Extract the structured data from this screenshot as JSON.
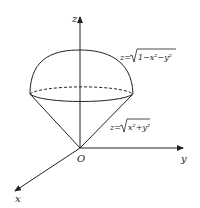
{
  "diagram": {
    "axes": {
      "z_label": "z",
      "y_label": "y",
      "x_label": "x",
      "origin_label": "O"
    },
    "surfaces": [
      {
        "name": "sphere",
        "equation_lhs": "z=",
        "equation_radicand": "1−x²−y²"
      },
      {
        "name": "cone",
        "equation_lhs": "z=",
        "equation_radicand": "x²+y²"
      }
    ],
    "colors": {
      "stroke": "#222222",
      "background": "#ffffff"
    }
  }
}
